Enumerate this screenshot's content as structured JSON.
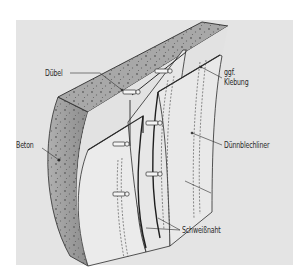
{
  "figure": {
    "type": "technical-illustration",
    "colors": {
      "page": "#ffffff",
      "panel": "#e4e4e4",
      "concrete_top": "#a8a8a8",
      "concrete_side": "#9c9c9c",
      "liner": "#e9e9e9",
      "liner_inner": "#dcdcdc",
      "line": "#2b2b2b"
    }
  },
  "labels": {
    "duebel": "Dübel",
    "klebung_line1": "ggf.",
    "klebung_line2": "Klebung",
    "beton": "Beton",
    "duennblechliner": "Dünnblechliner",
    "schweissnaht": "Schweißnaht"
  }
}
